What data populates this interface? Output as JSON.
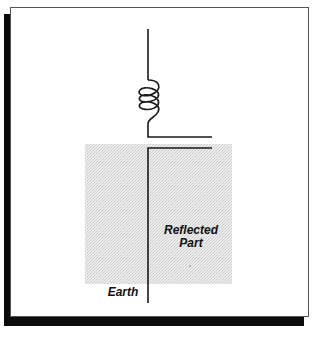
{
  "diagram": {
    "labels": {
      "reflected_part": "Reflected Part",
      "reflected_line1": "Reflected",
      "reflected_line2": "Part",
      "earth": "Earth"
    },
    "colors": {
      "line": "#1a1a1a",
      "ground_fill": "#e4e4e4",
      "shadow": "#0b0b0b",
      "frame_border": "#555555"
    },
    "elements": [
      "antenna-wire",
      "loading-coil",
      "ground-plane",
      "reflected-image"
    ]
  }
}
